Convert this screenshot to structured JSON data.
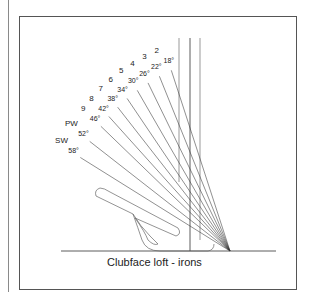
{
  "caption": "Clubface loft - irons",
  "clubs": [
    {
      "club": "2",
      "loft": "18°",
      "deg": 18
    },
    {
      "club": "3",
      "loft": "22°",
      "deg": 22
    },
    {
      "club": "4",
      "loft": "26°",
      "deg": 26
    },
    {
      "club": "5",
      "loft": "30°",
      "deg": 30
    },
    {
      "club": "6",
      "loft": "34°",
      "deg": 34
    },
    {
      "club": "7",
      "loft": "38°",
      "deg": 38
    },
    {
      "club": "8",
      "loft": "42°",
      "deg": 42
    },
    {
      "club": "9",
      "loft": "46°",
      "deg": 46
    },
    {
      "club": "PW",
      "loft": "52°",
      "deg": 52
    },
    {
      "club": "SW",
      "loft": "58°",
      "deg": 58
    }
  ],
  "colors": {
    "line": "#333333",
    "frame": "#555555"
  }
}
